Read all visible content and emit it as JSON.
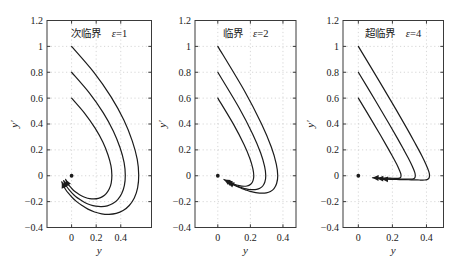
{
  "figure": {
    "background": "#ffffff",
    "curve_color": "#1b1b1b",
    "grid_color": "#c6c6c6",
    "frame_color": "#3a3a3a",
    "text_color": "#1a1a1a",
    "marker_color": "#1b1b1b"
  },
  "chart_data": [
    {
      "type": "line",
      "title": "次临界",
      "epsilon_symbol": "ε",
      "epsilon_eq": "=1",
      "xlabel": "y",
      "ylabel": "y′",
      "xlim": [
        -0.2,
        0.65
      ],
      "ylim": [
        -0.4,
        1.2
      ],
      "xticks": {
        "values": [
          0,
          0.2,
          0.4
        ],
        "labels": [
          "0",
          "0.2",
          "0.4"
        ]
      },
      "yticks": {
        "values": [
          1.2,
          1.0,
          0.8,
          0.6,
          0.4,
          0.2,
          0,
          -0.2,
          -0.4
        ],
        "labels": [
          "1.2",
          "1",
          "0.8",
          "0.6",
          "0.4",
          "0.2",
          "0",
          "−0.2",
          "−0.4"
        ]
      },
      "grid": "dotted",
      "fixed_point": [
        0,
        0
      ],
      "series": [
        {
          "name": "y′(0)=1.0",
          "scale": 1
        },
        {
          "name": "y′(0)=0.8",
          "scale": 0.8
        },
        {
          "name": "y′(0)=0.6",
          "scale": 0.6
        }
      ],
      "base_trajectory": [
        [
          0,
          1
        ],
        [
          0.18,
          0.801
        ],
        [
          0.321,
          0.61
        ],
        [
          0.425,
          0.431
        ],
        [
          0.494,
          0.268
        ],
        [
          0.534,
          0.126
        ],
        [
          0.546,
          0.005
        ],
        [
          0.537,
          -0.094
        ],
        [
          0.51,
          -0.172
        ],
        [
          0.469,
          -0.23
        ],
        [
          0.419,
          -0.269
        ],
        [
          0.363,
          -0.291
        ],
        [
          0.304,
          -0.298
        ],
        [
          0.245,
          -0.294
        ],
        [
          0.187,
          -0.28
        ],
        [
          0.133,
          -0.258
        ],
        [
          0.085,
          -0.23
        ],
        [
          0.041,
          -0.2
        ],
        [
          0.005,
          -0.168
        ],
        [
          -0.026,
          -0.135
        ],
        [
          -0.05,
          -0.104
        ],
        [
          -0.067,
          -0.074
        ],
        [
          -0.08,
          -0.047
        ]
      ]
    },
    {
      "type": "line",
      "title": "临界",
      "epsilon_symbol": "ε",
      "epsilon_eq": "=2",
      "xlabel": "y",
      "ylabel": "y′",
      "xlim": [
        -0.14,
        0.48
      ],
      "ylim": [
        -0.4,
        1.2
      ],
      "xticks": {
        "values": [
          0,
          0.2,
          0.4
        ],
        "labels": [
          "0",
          "0.2",
          "0.4"
        ]
      },
      "yticks": {
        "values": [
          1.2,
          1.0,
          0.8,
          0.6,
          0.4,
          0.2,
          0,
          -0.2,
          -0.4
        ],
        "labels": [
          "1.2",
          "1",
          "0.8",
          "0.6",
          "0.4",
          "0.2",
          "0",
          "−0.2",
          "−0.4"
        ]
      },
      "grid": "dotted",
      "fixed_point": [
        0,
        0
      ],
      "series": [
        {
          "name": "y′(0)=1.0",
          "scale": 1
        },
        {
          "name": "y′(0)=0.8",
          "scale": 0.8
        },
        {
          "name": "y′(0)=0.6",
          "scale": 0.6
        }
      ],
      "base_trajectory": [
        [
          0,
          1
        ],
        [
          0.164,
          0.655
        ],
        [
          0.268,
          0.402
        ],
        [
          0.329,
          0.22
        ],
        [
          0.359,
          0.09
        ],
        [
          0.368,
          0
        ],
        [
          0.361,
          -0.06
        ],
        [
          0.345,
          -0.099
        ],
        [
          0.323,
          -0.121
        ],
        [
          0.298,
          -0.132
        ],
        [
          0.271,
          -0.135
        ],
        [
          0.244,
          -0.133
        ],
        [
          0.218,
          -0.127
        ],
        [
          0.193,
          -0.119
        ],
        [
          0.17,
          -0.109
        ],
        [
          0.149,
          -0.1
        ],
        [
          0.122,
          -0.085
        ],
        [
          0.098,
          -0.071
        ],
        [
          0.079,
          -0.059
        ],
        [
          0.063,
          -0.048
        ]
      ]
    },
    {
      "type": "line",
      "title": "超临界",
      "epsilon_symbol": "ε",
      "epsilon_eq": "=4",
      "xlabel": "y",
      "ylabel": "y′",
      "xlim": [
        -0.09,
        0.5
      ],
      "ylim": [
        -0.4,
        1.2
      ],
      "xticks": {
        "values": [
          0,
          0.2,
          0.4
        ],
        "labels": [
          "0",
          "0.2",
          "0.4"
        ]
      },
      "yticks": {
        "values": [
          1.2,
          1.0,
          0.8,
          0.6,
          0.4,
          0.2,
          0,
          -0.2,
          -0.4
        ],
        "labels": [
          "1.2",
          "1",
          "0.8",
          "0.6",
          "0.4",
          "0.2",
          "0",
          "−0.2",
          "−0.4"
        ]
      },
      "grid": "dotted",
      "fixed_point": [
        0,
        0
      ],
      "series": [
        {
          "name": "y′(0)=1.0",
          "scale": 1
        },
        {
          "name": "y′(0)=0.8",
          "scale": 0.8
        },
        {
          "name": "y′(0)=0.6",
          "scale": 0.6
        }
      ],
      "base_trajectory": [
        [
          0,
          1
        ],
        [
          0.128,
          0.72
        ],
        [
          0.22,
          0.515
        ],
        [
          0.285,
          0.366
        ],
        [
          0.331,
          0.257
        ],
        [
          0.372,
          0.157
        ],
        [
          0.396,
          0.091
        ],
        [
          0.414,
          0.032
        ],
        [
          0.418,
          0.001
        ],
        [
          0.414,
          -0.02
        ],
        [
          0.403,
          -0.03
        ],
        [
          0.389,
          -0.033
        ],
        [
          0.359,
          -0.033
        ],
        [
          0.332,
          -0.032
        ],
        [
          0.294,
          -0.031
        ],
        [
          0.261,
          -0.03
        ],
        [
          0.222,
          -0.029
        ],
        [
          0.19,
          -0.028
        ],
        [
          0.162,
          -0.027
        ],
        [
          0.138,
          -0.026
        ]
      ]
    }
  ]
}
